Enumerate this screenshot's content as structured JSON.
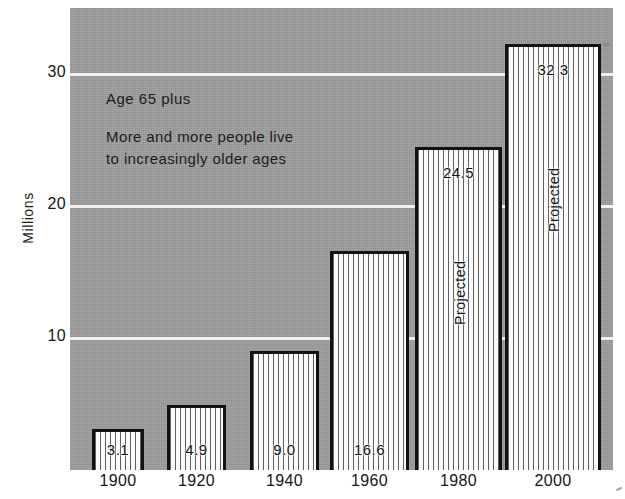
{
  "chart_data": {
    "type": "bar",
    "title": "",
    "annotation_title": "Age 65 plus",
    "annotation_lines": [
      "More and more people live",
      "to increasingly older ages"
    ],
    "categories": [
      "1900",
      "1920",
      "1940",
      "1960",
      "1980",
      "2000"
    ],
    "values": [
      3.1,
      4.9,
      9.0,
      16.6,
      24.5,
      32.3
    ],
    "value_labels": [
      "3.1",
      "4.9",
      "9.0",
      "16.6",
      "24.5",
      "32 3"
    ],
    "point_notes": [
      "",
      "",
      "",
      "",
      "Projected",
      "Projected"
    ],
    "xlabel": "",
    "ylabel": "Millions",
    "ylim": [
      0,
      35
    ],
    "yticks": [
      10,
      20,
      30
    ],
    "ytick_labels": [
      "10",
      "20",
      "30"
    ],
    "grid": true,
    "legend": "none",
    "colors": {
      "plot_background": "#9d9d9d",
      "gridline": "#f2f2f2",
      "bar_outline": "#121212",
      "bar_fill": "#fafafa",
      "bar_hatch": "#5f5f5f",
      "text": "#161616",
      "page_background": "#ffffff"
    }
  },
  "axis": {
    "y_title": "Millions"
  }
}
